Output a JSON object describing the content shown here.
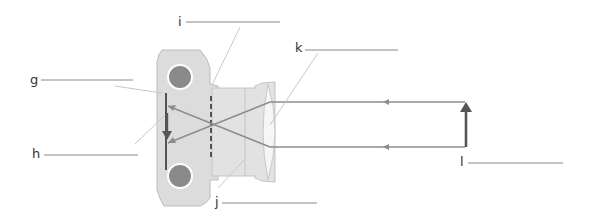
{
  "diagram": {
    "type": "camera-optics",
    "labels": [
      {
        "id": "g",
        "text": "g"
      },
      {
        "id": "h",
        "text": "h"
      },
      {
        "id": "i",
        "text": "i"
      },
      {
        "id": "j",
        "text": "j"
      },
      {
        "id": "k",
        "text": "k"
      },
      {
        "id": "l",
        "text": "l"
      }
    ],
    "colors": {
      "body_fill": "#dcdcdc",
      "body_stroke": "#b8b8b8",
      "roller": "#8a8a8a",
      "ray": "#8c8c8c",
      "leader": "#c8c8c8",
      "answer_line": "#888888",
      "arrow": "#555555",
      "film": "#333333"
    }
  }
}
